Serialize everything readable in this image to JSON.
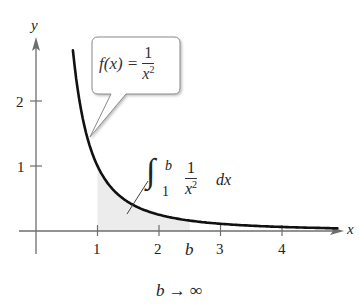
{
  "chart_data": {
    "type": "line",
    "title": "",
    "function": "f(x) = 1/x^2",
    "xlabel": "x",
    "ylabel": "y",
    "xlim": [
      -0.28,
      4.95
    ],
    "ylim": [
      -0.34,
      2.95
    ],
    "x_ticks": [
      1,
      2,
      3,
      4
    ],
    "y_ticks": [
      1,
      2
    ],
    "x_tick_labels": [
      "1",
      "2",
      "3",
      "4"
    ],
    "y_tick_labels": [
      "1",
      "2"
    ],
    "series": [
      {
        "name": "f(x) = 1/x^2",
        "x": [
          0.6,
          0.7,
          0.8,
          0.9,
          1.0,
          1.25,
          1.5,
          1.75,
          2.0,
          2.5,
          3.0,
          3.5,
          4.0,
          4.5,
          4.9
        ],
        "y": [
          2.78,
          2.04,
          1.56,
          1.23,
          1.0,
          0.64,
          0.44,
          0.33,
          0.25,
          0.16,
          0.11,
          0.08,
          0.06,
          0.05,
          0.04
        ]
      }
    ],
    "shaded_region": {
      "from": 1,
      "to": 2.5,
      "description": "area under curve from 1 to b"
    },
    "b_position": 2.5,
    "grid": false,
    "legend": null,
    "annotations": {
      "callout": {
        "lhs": "f(x) =",
        "numerator": "1",
        "denominator": "x",
        "exponent": "2"
      },
      "integral": {
        "upper": "b",
        "lower": "1",
        "numerator": "1",
        "denominator": "x",
        "exponent": "2",
        "differential": "dx"
      },
      "b_tick_label": "b",
      "limit": "b → ∞"
    }
  }
}
